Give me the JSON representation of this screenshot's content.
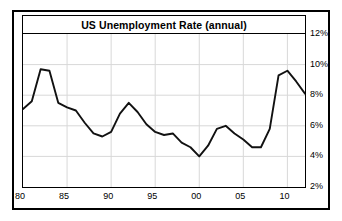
{
  "chart": {
    "title": "US Unemployment Rate (annual)"
  },
  "axes": {
    "y_ticks": [
      "2%",
      "4%",
      "6%",
      "8%",
      "10%",
      "12%"
    ],
    "x_ticks": [
      "80",
      "85",
      "90",
      "95",
      "00",
      "05",
      "10"
    ]
  },
  "colors": {
    "line": "#111111",
    "grid": "#d8d8d8",
    "border": "#000000",
    "background": "#ffffff"
  },
  "chart_data": {
    "type": "line",
    "title": "US Unemployment Rate (annual)",
    "xlabel": "",
    "ylabel": "",
    "xlim": [
      1980,
      2012
    ],
    "ylim": [
      2,
      12
    ],
    "ytick_values": [
      2,
      4,
      6,
      8,
      10,
      12
    ],
    "ytick_labels": [
      "2%",
      "4%",
      "6%",
      "8%",
      "10%",
      "12%"
    ],
    "xtick_values": [
      1980,
      1985,
      1990,
      1995,
      2000,
      2005,
      2010
    ],
    "xtick_labels": [
      "80",
      "85",
      "90",
      "95",
      "00",
      "05",
      "10"
    ],
    "grid": true,
    "legend": false,
    "x": [
      1980,
      1981,
      1982,
      1983,
      1984,
      1985,
      1986,
      1987,
      1988,
      1989,
      1990,
      1991,
      1992,
      1993,
      1994,
      1995,
      1996,
      1997,
      1998,
      1999,
      2000,
      2001,
      2002,
      2003,
      2004,
      2005,
      2006,
      2007,
      2008,
      2009,
      2010,
      2011,
      2012
    ],
    "values": [
      7.1,
      7.6,
      9.7,
      9.6,
      7.5,
      7.2,
      7.0,
      6.2,
      5.5,
      5.3,
      5.6,
      6.8,
      7.5,
      6.9,
      6.1,
      5.6,
      5.4,
      5.5,
      4.9,
      4.6,
      4.0,
      4.7,
      5.8,
      6.0,
      5.5,
      5.1,
      4.6,
      4.6,
      5.8,
      9.3,
      9.6,
      8.9,
      8.1
    ],
    "series": [
      {
        "name": "US Unemployment Rate",
        "values": [
          7.1,
          7.6,
          9.7,
          9.6,
          7.5,
          7.2,
          7.0,
          6.2,
          5.5,
          5.3,
          5.6,
          6.8,
          7.5,
          6.9,
          6.1,
          5.6,
          5.4,
          5.5,
          4.9,
          4.6,
          4.0,
          4.7,
          5.8,
          6.0,
          5.5,
          5.1,
          4.6,
          4.6,
          5.8,
          9.3,
          9.6,
          8.9,
          8.1
        ]
      }
    ]
  }
}
